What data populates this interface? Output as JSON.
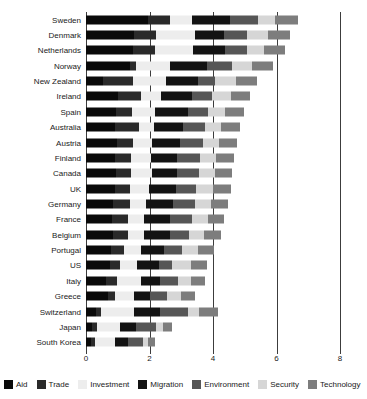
{
  "chart_data": {
    "type": "bar",
    "subtype": "stacked-horizontal",
    "title": "",
    "xlabel": "",
    "ylabel": "",
    "xlim": [
      0,
      8
    ],
    "xticks": [
      0,
      2,
      4,
      6,
      8
    ],
    "xtick_labels": [
      "0",
      "2",
      "4",
      "6",
      "8"
    ],
    "grid": true,
    "legend_position": "bottom",
    "orientation": "horizontal",
    "categories": [
      "Sweden",
      "Denmark",
      "Netherlands",
      "Norway",
      "New Zealand",
      "Ireland",
      "Spain",
      "Australia",
      "Austria",
      "Finland",
      "Canada",
      "UK",
      "Germany",
      "France",
      "Belgium",
      "Portugal",
      "US",
      "Italy",
      "Greece",
      "Switzerland",
      "Japan",
      "South Korea"
    ],
    "series": [
      {
        "name": "Aid",
        "color": "#0a0a0a",
        "values": [
          1.95,
          1.5,
          1.48,
          1.38,
          0.52,
          1.02,
          0.95,
          0.92,
          0.98,
          0.9,
          0.95,
          0.92,
          0.86,
          0.82,
          0.84,
          0.78,
          0.76,
          0.62,
          0.7,
          0.3,
          0.2,
          0.15
        ]
      },
      {
        "name": "Trade",
        "color": "#2a2a2a",
        "values": [
          0.7,
          0.72,
          0.7,
          0.18,
          0.95,
          0.72,
          0.5,
          0.74,
          0.5,
          0.52,
          0.48,
          0.48,
          0.52,
          0.5,
          0.48,
          0.42,
          0.3,
          0.36,
          0.22,
          0.18,
          0.16,
          0.14
        ]
      },
      {
        "name": "Investment",
        "color": "#ededed",
        "values": [
          0.68,
          1.22,
          1.2,
          1.08,
          1.05,
          0.62,
          0.72,
          0.48,
          0.6,
          0.62,
          0.64,
          0.6,
          0.5,
          0.52,
          0.5,
          0.52,
          0.54,
          0.76,
          0.58,
          1.02,
          0.72,
          0.62
        ]
      },
      {
        "name": "Migration",
        "color": "#131313",
        "values": [
          1.22,
          0.92,
          1.0,
          1.18,
          1.02,
          0.98,
          1.05,
          0.92,
          0.88,
          0.84,
          0.8,
          0.82,
          0.86,
          0.8,
          0.82,
          0.74,
          0.7,
          0.58,
          0.52,
          0.82,
          0.5,
          0.42
        ]
      },
      {
        "name": "Environment",
        "color": "#565656",
        "values": [
          0.88,
          0.72,
          0.7,
          0.78,
          0.52,
          0.64,
          0.62,
          0.68,
          0.74,
          0.72,
          0.68,
          0.64,
          0.68,
          0.7,
          0.62,
          0.58,
          0.42,
          0.58,
          0.54,
          0.88,
          0.62,
          0.46
        ]
      },
      {
        "name": "Security",
        "color": "#d6d6d6",
        "values": [
          0.52,
          0.64,
          0.52,
          0.62,
          0.66,
          0.58,
          0.54,
          0.52,
          0.48,
          0.5,
          0.52,
          0.54,
          0.52,
          0.5,
          0.46,
          0.48,
          0.58,
          0.4,
          0.42,
          0.36,
          0.22,
          0.18
        ]
      },
      {
        "name": "Technology",
        "color": "#7d7d7d",
        "values": [
          0.74,
          0.7,
          0.68,
          0.68,
          0.68,
          0.62,
          0.6,
          0.6,
          0.58,
          0.56,
          0.54,
          0.56,
          0.52,
          0.52,
          0.54,
          0.52,
          0.5,
          0.46,
          0.44,
          0.6,
          0.3,
          0.22
        ]
      }
    ]
  },
  "legend": {
    "items": [
      {
        "label": "Aid",
        "color": "#0a0a0a"
      },
      {
        "label": "Trade",
        "color": "#2a2a2a"
      },
      {
        "label": "Investment",
        "color": "#ededed"
      },
      {
        "label": "Migration",
        "color": "#131313"
      },
      {
        "label": "Environment",
        "color": "#565656"
      },
      {
        "label": "Security",
        "color": "#d6d6d6"
      },
      {
        "label": "Technology",
        "color": "#7d7d7d"
      }
    ]
  }
}
